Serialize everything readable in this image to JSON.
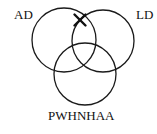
{
  "diagram": {
    "type": "venn",
    "sets": [
      {
        "id": "set-ad",
        "label": "AD",
        "cx": 64,
        "cy": 40,
        "r": 32,
        "label_x": 14,
        "label_y": 19
      },
      {
        "id": "set-ld",
        "label": "LD",
        "cx": 103,
        "cy": 41,
        "r": 31,
        "label_x": 136,
        "label_y": 19
      },
      {
        "id": "set-pwhnhaa",
        "label": "PWHNHAA",
        "cx": 85,
        "cy": 74,
        "r": 31,
        "label_x": 48,
        "label_y": 120
      }
    ],
    "marker": {
      "symbol": "X",
      "region": "AD ∩ LD (outside PWHNHAA)",
      "x": 80,
      "y": 20,
      "size": 5.5
    },
    "colors": {
      "stroke": "#1a1a1a",
      "text": "#111111",
      "background": "#ffffff"
    }
  }
}
